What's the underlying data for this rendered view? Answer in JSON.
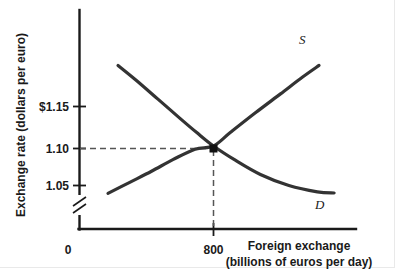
{
  "chart_data": {
    "type": "line",
    "title": "",
    "xlabel": "Foreign exchange",
    "xlabel_sub": "(billions of euros per day)",
    "ylabel": "Exchange rate (dollars per euro)",
    "y_ticks": [
      "$1.15",
      "1.10",
      "1.05"
    ],
    "y_tick_values": [
      1.15,
      1.1,
      1.05
    ],
    "x_ticks": [
      "800"
    ],
    "x_tick_values": [
      800
    ],
    "origin_label": "0",
    "ylim": [
      1.02,
      1.215
    ],
    "xlim": [
      0,
      1600
    ],
    "grid": false,
    "axis_break": true,
    "axis_break_axis": "y",
    "legend_position": "inline-curve-end",
    "series": [
      {
        "name": "Supply",
        "label": "S",
        "label_x": 1720,
        "label_y": 1.1965,
        "points": [
          [
            170,
            1.04
          ],
          [
            300,
            1.054
          ],
          [
            430,
            1.068
          ],
          [
            560,
            1.083
          ],
          [
            690,
            1.096
          ],
          [
            800,
            1.1
          ],
          [
            900,
            1.117
          ],
          [
            1050,
            1.142
          ],
          [
            1200,
            1.166
          ],
          [
            1330,
            1.187
          ],
          [
            1430,
            1.202
          ]
        ]
      },
      {
        "name": "Demand",
        "label": "D",
        "label_x": 1790,
        "label_y": 1.0445,
        "points": [
          [
            230,
            1.202
          ],
          [
            340,
            1.183
          ],
          [
            470,
            1.159
          ],
          [
            600,
            1.135
          ],
          [
            700,
            1.117
          ],
          [
            800,
            1.1
          ],
          [
            930,
            1.082
          ],
          [
            1080,
            1.064
          ],
          [
            1250,
            1.05
          ],
          [
            1420,
            1.042
          ],
          [
            1520,
            1.0405
          ]
        ]
      }
    ],
    "equilibrium": {
      "x": 800,
      "y": 1.1,
      "marker": "square",
      "guide_lines": "dashed"
    },
    "colors": {
      "curve": "#333333",
      "axis": "#1a1a1a",
      "text": "#1a1a1a",
      "background": "#ffffff",
      "guide": "#555555"
    }
  },
  "icons": {
    "axis_break": "axis-break-slashes",
    "equilibrium_marker": "square-marker"
  }
}
